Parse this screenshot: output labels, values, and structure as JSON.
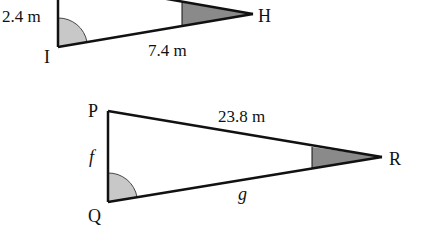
{
  "triangle_top": {
    "vertices": {
      "I": "I",
      "H": "H"
    },
    "sides": {
      "vertical": "2.4 m",
      "bottom": "7.4 m"
    }
  },
  "triangle_bottom": {
    "vertices": {
      "P": "P",
      "Q": "Q",
      "R": "R"
    },
    "sides": {
      "PR": "23.8 m",
      "PQ": "f",
      "QR": "g"
    }
  },
  "colors": {
    "line": "#111111",
    "right_angle_fill": "#c8c8c8",
    "acute_angle_fill": "#8a8a8a"
  }
}
